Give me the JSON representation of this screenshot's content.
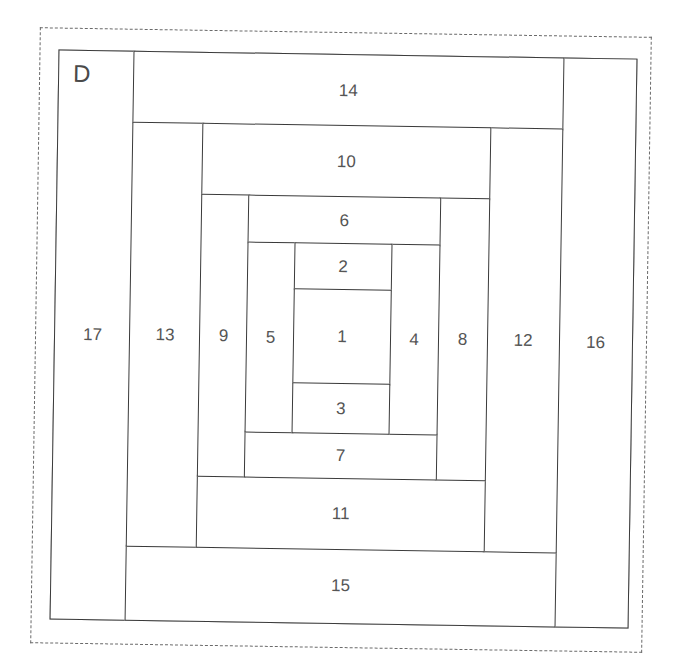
{
  "block": {
    "label": "D",
    "pattern": "Log Cabin (off-center)",
    "line_color": "#3a3a3a",
    "text_color": "#555555"
  },
  "pieces": {
    "p1": "1",
    "p2": "2",
    "p3": "3",
    "p4": "4",
    "p5": "5",
    "p6": "6",
    "p7": "7",
    "p8": "8",
    "p9": "9",
    "p10": "10",
    "p11": "11",
    "p12": "12",
    "p13": "13",
    "p14": "14",
    "p15": "15",
    "p16": "16",
    "p17": "17"
  }
}
